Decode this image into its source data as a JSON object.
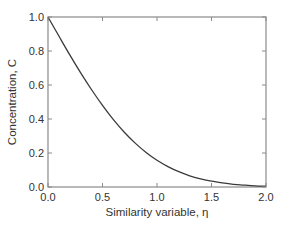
{
  "chart_data": {
    "type": "line",
    "title": "",
    "xlabel": "Similarity variable, η",
    "ylabel": "Concentration, C",
    "xlim": [
      0.0,
      2.0
    ],
    "ylim": [
      0.0,
      1.0
    ],
    "grid": false,
    "legend": null,
    "x_ticks": [
      "0.0",
      "0.5",
      "1.0",
      "1.5",
      "2.0"
    ],
    "y_ticks": [
      "0.0",
      "0.2",
      "0.4",
      "0.6",
      "0.8",
      "1.0"
    ],
    "series": [
      {
        "name": "C = erfc(η)",
        "x": [
          0.0,
          0.1,
          0.2,
          0.3,
          0.4,
          0.5,
          0.6,
          0.7,
          0.8,
          0.9,
          1.0,
          1.1,
          1.2,
          1.3,
          1.4,
          1.5,
          1.6,
          1.7,
          1.8,
          1.9,
          2.0
        ],
        "values": [
          1.0,
          0.888,
          0.777,
          0.671,
          0.572,
          0.48,
          0.396,
          0.322,
          0.258,
          0.203,
          0.157,
          0.12,
          0.09,
          0.066,
          0.048,
          0.034,
          0.024,
          0.016,
          0.011,
          0.007,
          0.005
        ]
      }
    ]
  },
  "colors": {
    "axis": "#8a8a8a",
    "curve": "#3a3a3a",
    "text": "#333333"
  }
}
